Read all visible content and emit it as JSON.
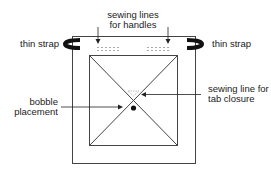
{
  "labels": {
    "handles_line1": "sewing lines",
    "handles_line2": "for handles",
    "strap_left": "thin strap",
    "strap_right": "thin strap",
    "tab_line1": "sewing line for",
    "tab_line2": "tab closure",
    "bobble_line1": "bobble",
    "bobble_line2": "placement"
  },
  "colors": {
    "line": "#333333",
    "strap": "#111111",
    "stitch": "#aaaaaa"
  }
}
